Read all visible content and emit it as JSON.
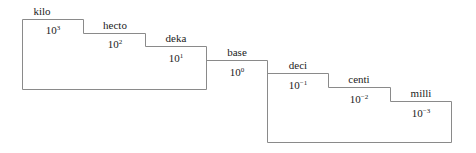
{
  "diagram": {
    "steps": [
      {
        "name": "kilo",
        "base": "10",
        "exp": "3"
      },
      {
        "name": "hecto",
        "base": "10",
        "exp": "2"
      },
      {
        "name": "deka",
        "base": "10",
        "exp": "1"
      },
      {
        "name": "base",
        "base": "10",
        "exp": "0"
      },
      {
        "name": "deci",
        "base": "10",
        "exp": "−1"
      },
      {
        "name": "centi",
        "base": "10",
        "exp": "−2"
      },
      {
        "name": "milli",
        "base": "10",
        "exp": "−3"
      }
    ],
    "line_color": "#8a8a8a"
  }
}
